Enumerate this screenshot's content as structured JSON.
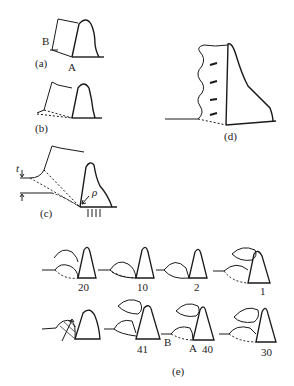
{
  "figure": {
    "panels": {
      "a": {
        "label": "(a)",
        "point_b": "B",
        "point_a": "A"
      },
      "b": {
        "label": "(b)"
      },
      "c": {
        "label": "(c)",
        "thickness_symbol": "t",
        "radius_symbol": "ρ"
      },
      "d": {
        "label": "(d)"
      },
      "e": {
        "label": "(e)",
        "row1": [
          "20",
          "10",
          "2",
          "1"
        ],
        "row2": [
          "41",
          "40",
          "30"
        ],
        "point_b": "B",
        "point_a": "A"
      }
    },
    "colors": {
      "line": "#1a1a1a",
      "background": "#ffffff"
    }
  }
}
